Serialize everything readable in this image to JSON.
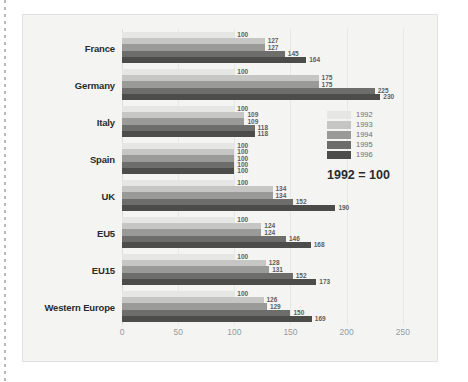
{
  "chart_data": {
    "type": "bar",
    "orientation": "horizontal",
    "title": "",
    "subtitle": "",
    "note": "1992 = 100",
    "xlabel": "",
    "ylabel": "",
    "xlim": [
      0,
      268
    ],
    "xticks": [
      0,
      50,
      100,
      150,
      200,
      250
    ],
    "grid": true,
    "legend_position": "right",
    "categories": [
      "France",
      "Germany",
      "Italy",
      "Spain",
      "UK",
      "EU5",
      "EU15",
      "Western Europe"
    ],
    "series": [
      {
        "name": "1992",
        "color": "#e6e6e4",
        "values": [
          100,
          100,
          100,
          100,
          100,
          100,
          100,
          100
        ]
      },
      {
        "name": "1993",
        "color": "#c6c6c4",
        "values": [
          127,
          175,
          109,
          100,
          134,
          124,
          128,
          126
        ]
      },
      {
        "name": "1994",
        "color": "#9a9a98",
        "values": [
          127,
          175,
          109,
          100,
          134,
          124,
          131,
          129
        ]
      },
      {
        "name": "1995",
        "color": "#6d6d6b",
        "values": [
          145,
          225,
          118,
          100,
          152,
          146,
          152,
          150
        ]
      },
      {
        "name": "1996",
        "color": "#4c4c4a",
        "values": [
          164,
          230,
          118,
          100,
          190,
          168,
          173,
          169
        ]
      }
    ]
  },
  "legend": {
    "items": [
      {
        "label": "1992"
      },
      {
        "label": "1993"
      },
      {
        "label": "1994"
      },
      {
        "label": "1995"
      },
      {
        "label": "1996"
      }
    ],
    "note": "1992 = 100"
  },
  "colors": {
    "panel_bg": "#f4f4f3",
    "panel_border": "#e2e2e0",
    "gridline": "#e7e7e5",
    "tick_text": "#9a9a9a",
    "category_text": "#2b2b2b",
    "value_text": "#5d5d5d"
  }
}
